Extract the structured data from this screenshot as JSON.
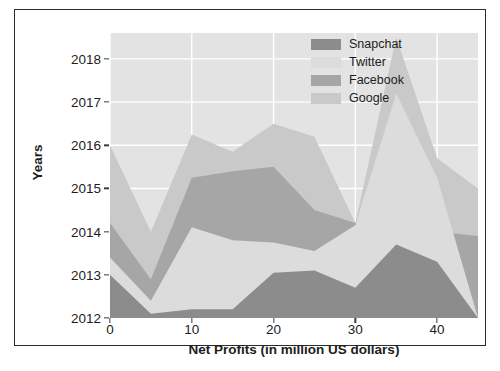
{
  "chart_data": {
    "type": "area",
    "stacked": true,
    "orientation": "stacked-area",
    "title": "",
    "xlabel": "Net Profits (in million US dollars)",
    "ylabel": "Years",
    "xlim": [
      0,
      45
    ],
    "ylim": [
      2012,
      2018.6
    ],
    "xticks": [
      0,
      10,
      20,
      30,
      40
    ],
    "xtick_labels": [
      "0",
      "10",
      "20",
      "30",
      "40"
    ],
    "yticks": [
      2012,
      2013,
      2014,
      2015,
      2016,
      2017,
      2018
    ],
    "ytick_labels": [
      "2012",
      "2013",
      "2014",
      "2015",
      "2016",
      "2017",
      "2018"
    ],
    "grid": true,
    "grid_color": "#ffffff",
    "plot_background": "#e3e3e3",
    "legend_position": "top-right",
    "x": [
      0,
      5,
      10,
      15,
      20,
      25,
      30,
      35,
      40,
      45
    ],
    "baseline": 2012,
    "series": [
      {
        "name": "Snapchat",
        "color": "#8c8c8c",
        "cumulative_top": [
          2013.0,
          2012.1,
          2012.2,
          2012.2,
          2013.05,
          2013.1,
          2012.7,
          2013.7,
          2013.3,
          2012.0
        ]
      },
      {
        "name": "Twitter",
        "color": "#dcdcdc",
        "cumulative_top": [
          2013.4,
          2012.4,
          2014.1,
          2013.8,
          2013.75,
          2013.55,
          2014.15,
          2017.2,
          2015.25,
          2012.0
        ]
      },
      {
        "name": "Facebook",
        "color": "#a6a6a6",
        "cumulative_top": [
          2014.2,
          2012.9,
          2015.25,
          2015.4,
          2015.5,
          2014.5,
          2014.2,
          2015.5,
          2014.0,
          2013.9
        ]
      },
      {
        "name": "Google",
        "color": "#c9c9c9",
        "cumulative_top": [
          2016.0,
          2014.0,
          2016.25,
          2015.85,
          2016.5,
          2016.2,
          2014.2,
          2018.5,
          2015.7,
          2015.0
        ]
      }
    ]
  },
  "legend": {
    "items": [
      {
        "label": "Snapchat",
        "color": "#8c8c8c"
      },
      {
        "label": "Twitter",
        "color": "#dcdcdc"
      },
      {
        "label": "Facebook",
        "color": "#a6a6a6"
      },
      {
        "label": "Google",
        "color": "#c9c9c9"
      }
    ]
  }
}
